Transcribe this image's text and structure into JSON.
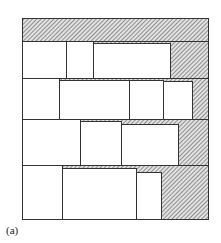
{
  "figure": {
    "label": "(a)",
    "frame": {
      "x": 22,
      "y": 18,
      "w": 186,
      "h": 201
    },
    "colors": {
      "line": "#333333",
      "hatch": "#555555",
      "fill": "#ffffff",
      "hatch_bg": "#d9d9d9"
    },
    "hatched_regions": [
      {
        "name": "top-band",
        "x": 22,
        "y": 18,
        "w": 186,
        "h": 23
      },
      {
        "name": "row1-right",
        "x": 170,
        "y": 41,
        "w": 38,
        "h": 37
      },
      {
        "name": "row1-strip",
        "x": 93,
        "y": 41,
        "w": 77,
        "h": 2
      },
      {
        "name": "row2-right",
        "x": 192,
        "y": 78,
        "w": 16,
        "h": 41
      },
      {
        "name": "row2-strip",
        "x": 59,
        "y": 78,
        "w": 133,
        "h": 3
      },
      {
        "name": "row3-right",
        "x": 178,
        "y": 119,
        "w": 30,
        "h": 46
      },
      {
        "name": "row3-strip",
        "x": 80,
        "y": 119,
        "w": 98,
        "h": 5
      },
      {
        "name": "row4-right",
        "x": 161,
        "y": 165,
        "w": 47,
        "h": 54
      },
      {
        "name": "row4-strip",
        "x": 62,
        "y": 165,
        "w": 99,
        "h": 7
      }
    ],
    "rows": [
      {
        "name": "row-1",
        "y": 41,
        "h": 37,
        "boxes": [
          {
            "x": 22,
            "y": 41,
            "w": 44,
            "h": 37
          },
          {
            "x": 66,
            "y": 41,
            "w": 27,
            "h": 37
          },
          {
            "x": 93,
            "y": 43,
            "w": 77,
            "h": 35
          }
        ]
      },
      {
        "name": "row-2",
        "y": 78,
        "h": 41,
        "boxes": [
          {
            "x": 22,
            "y": 78,
            "w": 37,
            "h": 41
          },
          {
            "x": 59,
            "y": 80,
            "w": 70,
            "h": 39
          },
          {
            "x": 129,
            "y": 80,
            "w": 34,
            "h": 39
          },
          {
            "x": 163,
            "y": 81,
            "w": 29,
            "h": 38
          }
        ]
      },
      {
        "name": "row-3",
        "y": 119,
        "h": 46,
        "boxes": [
          {
            "x": 22,
            "y": 119,
            "w": 58,
            "h": 46
          },
          {
            "x": 80,
            "y": 121,
            "w": 41,
            "h": 44
          },
          {
            "x": 121,
            "y": 124,
            "w": 57,
            "h": 41
          }
        ]
      },
      {
        "name": "row-4",
        "y": 165,
        "h": 54,
        "boxes": [
          {
            "x": 22,
            "y": 165,
            "w": 40,
            "h": 54
          },
          {
            "x": 62,
            "y": 168,
            "w": 74,
            "h": 51
          },
          {
            "x": 136,
            "y": 172,
            "w": 25,
            "h": 47
          }
        ]
      }
    ]
  }
}
